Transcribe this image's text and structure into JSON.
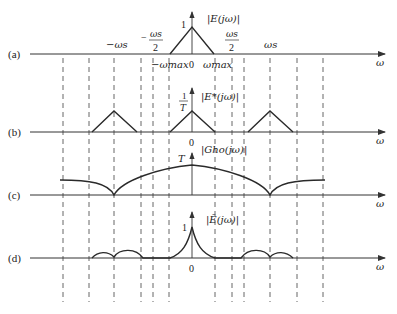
{
  "panels": [
    {
      "id": "a",
      "label": "(a)",
      "func_label": "|E(jω)|",
      "peak_label": "1",
      "axis_label": "ω",
      "zero_label": "0"
    },
    {
      "id": "b",
      "label": "(b)",
      "func_label": "|E*(jω)|",
      "peak_label_num": "1",
      "peak_label_den": "T",
      "axis_label": "ω",
      "zero_label": "0"
    },
    {
      "id": "c",
      "label": "(c)",
      "func_label": "|Gho(jω)|",
      "peak_label": "T",
      "axis_label": "ω"
    },
    {
      "id": "d",
      "label": "(d)",
      "func_label": "|Ē(jω)|",
      "peak_label": "1",
      "axis_label": "ω",
      "zero_label": "0"
    }
  ],
  "tick_labels": {
    "neg_ws": "−ωs",
    "neg_ws_half_num": "ωs",
    "neg_ws_half_den": "2",
    "neg_wmax": "−ωmax",
    "wmax": "ωmax",
    "ws_half_num": "ωs",
    "ws_half_den": "2",
    "ws": "ωs"
  },
  "colors": {
    "line": "#2a2a2a",
    "dash": "#555555",
    "axis": "#444444"
  }
}
